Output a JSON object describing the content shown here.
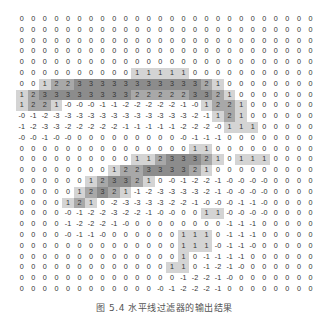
{
  "figure": {
    "caption": "图 5.4  水平线过滤器的输出结果",
    "rows": 26,
    "cols": 26,
    "shading": {
      "1": "#d4d4d4",
      "2": "#a8a8a8",
      "3": "#8c8c8c"
    },
    "grid": [
      [
        "0",
        "0",
        "0",
        "0",
        "0",
        "0",
        "0",
        "0",
        "0",
        "0",
        "0",
        "0",
        "0",
        "0",
        "0",
        "0",
        "0",
        "0",
        "0",
        "0",
        "0",
        "0",
        "0",
        "0",
        "0",
        "0"
      ],
      [
        "0",
        "0",
        "0",
        "0",
        "0",
        "0",
        "0",
        "0",
        "0",
        "0",
        "0",
        "0",
        "0",
        "0",
        "0",
        "0",
        "0",
        "0",
        "0",
        "0",
        "0",
        "0",
        "0",
        "0",
        "0",
        "0"
      ],
      [
        "0",
        "0",
        "0",
        "0",
        "0",
        "0",
        "0",
        "0",
        "0",
        "0",
        "0",
        "0",
        "0",
        "0",
        "0",
        "0",
        "0",
        "0",
        "0",
        "0",
        "0",
        "0",
        "0",
        "0",
        "0",
        "0"
      ],
      [
        "0",
        "0",
        "0",
        "0",
        "0",
        "0",
        "0",
        "0",
        "0",
        "0",
        "0",
        "0",
        "0",
        "0",
        "0",
        "0",
        "0",
        "0",
        "0",
        "0",
        "0",
        "0",
        "0",
        "0",
        "0",
        "0"
      ],
      [
        "0",
        "0",
        "0",
        "0",
        "0",
        "0",
        "0",
        "0",
        "0",
        "0",
        "0",
        "0",
        "0",
        "0",
        "0",
        "0",
        "0",
        "0",
        "0",
        "0",
        "0",
        "0",
        "0",
        "0",
        "0",
        "0"
      ],
      [
        "0",
        "0",
        "0",
        "0",
        "0",
        "0",
        "0",
        "0",
        "0",
        "0",
        "1",
        "1",
        "1",
        "1",
        "1",
        "0",
        "0",
        "0",
        "0",
        "0",
        "0",
        "0",
        "0",
        "0",
        "0",
        "0"
      ],
      [
        "0",
        "0",
        "1",
        "2",
        "2",
        "3",
        "3",
        "3",
        "3",
        "3",
        "3",
        "3",
        "3",
        "3",
        "3",
        "3",
        "2",
        "1",
        "0",
        "0",
        "0",
        "0",
        "0",
        "0",
        "0",
        "0"
      ],
      [
        "1",
        "2",
        "3",
        "3",
        "3",
        "3",
        "3",
        "3",
        "3",
        "3",
        "2",
        "2",
        "2",
        "2",
        "2",
        "3",
        "3",
        "2",
        "1",
        "0",
        "0",
        "0",
        "0",
        "0",
        "0",
        "0"
      ],
      [
        "1",
        "2",
        "2",
        "1",
        "-0",
        "-0",
        "-0",
        "-1",
        "-1",
        "-2",
        "-2",
        "-2",
        "-2",
        "-2",
        "-1",
        "-0",
        "1",
        "2",
        "2",
        "1",
        "0",
        "0",
        "0",
        "0",
        "0",
        "0"
      ],
      [
        "-0",
        "-1",
        "-2",
        "-3",
        "-3",
        "-3",
        "-3",
        "-3",
        "-3",
        "-3",
        "-3",
        "-3",
        "-3",
        "-3",
        "-3",
        "-2",
        "-1",
        "1",
        "2",
        "1",
        "0",
        "0",
        "0",
        "0",
        "0",
        "0"
      ],
      [
        "-1",
        "-2",
        "-3",
        "-3",
        "-2",
        "-2",
        "-2",
        "-2",
        "-2",
        "-1",
        "-1",
        "-1",
        "-1",
        "-1",
        "-2",
        "-2",
        "-2",
        "-0",
        "1",
        "1",
        "1",
        "0",
        "0",
        "0",
        "0",
        "0"
      ],
      [
        "-0",
        "-0",
        "-1",
        "-0",
        "-0",
        "0",
        "0",
        "0",
        "0",
        "0",
        "0",
        "0",
        "0",
        "0",
        "-0",
        "-1",
        "-1",
        "-1",
        "0",
        "0",
        "0",
        "0",
        "0",
        "0",
        "0",
        "0"
      ],
      [
        "0",
        "0",
        "0",
        "0",
        "0",
        "0",
        "0",
        "0",
        "0",
        "0",
        "0",
        "0",
        "0",
        "0",
        "0",
        "1",
        "1",
        "0",
        "0",
        "0",
        "0",
        "0",
        "0",
        "0",
        "0",
        "0"
      ],
      [
        "0",
        "0",
        "0",
        "0",
        "0",
        "0",
        "0",
        "0",
        "0",
        "0",
        "1",
        "1",
        "2",
        "3",
        "3",
        "3",
        "2",
        "1",
        "0",
        "1",
        "1",
        "1",
        "0",
        "0",
        "0",
        "0"
      ],
      [
        "0",
        "0",
        "0",
        "0",
        "0",
        "0",
        "0",
        "0",
        "1",
        "2",
        "2",
        "3",
        "3",
        "3",
        "3",
        "2",
        "1",
        "0",
        "0",
        "0",
        "0",
        "0",
        "0",
        "0",
        "0",
        "0"
      ],
      [
        "0",
        "0",
        "0",
        "0",
        "0",
        "0",
        "1",
        "2",
        "3",
        "3",
        "2",
        "1",
        "0",
        "-0",
        "-1",
        "-2",
        "-2",
        "-1",
        "-0",
        "-0",
        "-0",
        "-0",
        "0",
        "0",
        "0",
        "0"
      ],
      [
        "0",
        "0",
        "0",
        "0",
        "0",
        "1",
        "2",
        "3",
        "2",
        "1",
        "-1",
        "-2",
        "-3",
        "-3",
        "-3",
        "-3",
        "-2",
        "-1",
        "-0",
        "-0",
        "-0",
        "-0",
        "0",
        "0",
        "0",
        "0"
      ],
      [
        "0",
        "0",
        "0",
        "0",
        "1",
        "2",
        "1",
        "0",
        "-2",
        "-3",
        "-3",
        "-3",
        "-3",
        "-2",
        "-2",
        "-1",
        "-0",
        "-0",
        "-0",
        "-1",
        "-1",
        "-0",
        "0",
        "0",
        "0",
        "0"
      ],
      [
        "0",
        "0",
        "0",
        "0",
        "-0",
        "-1",
        "-2",
        "-2",
        "-3",
        "-2",
        "-2",
        "-1",
        "-0",
        "-0",
        "0",
        "0",
        "1",
        "1",
        "-0",
        "-0",
        "-0",
        "-0",
        "0",
        "0",
        "0",
        "0"
      ],
      [
        "0",
        "0",
        "0",
        "0",
        "-1",
        "-2",
        "-2",
        "-2",
        "-1",
        "-0",
        "0",
        "0",
        "0",
        "0",
        "0",
        "0",
        "0",
        "0",
        "-1",
        "-1",
        "-1",
        "0",
        "0",
        "0",
        "0",
        "0"
      ],
      [
        "0",
        "0",
        "0",
        "0",
        "-0",
        "-1",
        "-1",
        "-0",
        "0",
        "0",
        "0",
        "0",
        "0",
        "0",
        "1",
        "1",
        "1",
        "0",
        "-1",
        "-1",
        "-1",
        "0",
        "0",
        "0",
        "0",
        "0"
      ],
      [
        "0",
        "0",
        "0",
        "0",
        "0",
        "0",
        "0",
        "0",
        "0",
        "0",
        "0",
        "0",
        "0",
        "0",
        "1",
        "1",
        "1",
        "-0",
        "-1",
        "-1",
        "-0",
        "0",
        "0",
        "0",
        "0",
        "0"
      ],
      [
        "0",
        "0",
        "0",
        "0",
        "0",
        "0",
        "0",
        "0",
        "0",
        "0",
        "0",
        "0",
        "0",
        "0",
        "1",
        "0",
        "-1",
        "-1",
        "-1",
        "-1",
        "0",
        "0",
        "0",
        "0",
        "0",
        "0"
      ],
      [
        "0",
        "0",
        "0",
        "0",
        "0",
        "0",
        "0",
        "0",
        "0",
        "0",
        "0",
        "0",
        "0",
        "1",
        "1",
        "0",
        "-1",
        "-2",
        "-1",
        "-0",
        "0",
        "0",
        "0",
        "0",
        "0",
        "0"
      ],
      [
        "0",
        "0",
        "0",
        "0",
        "0",
        "0",
        "0",
        "0",
        "0",
        "0",
        "0",
        "0",
        "0",
        "0",
        "-1",
        "-2",
        "-2",
        "-1",
        "-0",
        "0",
        "0",
        "0",
        "0",
        "0",
        "0",
        "0"
      ],
      [
        "0",
        "0",
        "0",
        "0",
        "0",
        "0",
        "0",
        "0",
        "0",
        "0",
        "0",
        "0",
        "-0",
        "-1",
        "-2",
        "-2",
        "-2",
        "-1",
        "0",
        "0",
        "0",
        "0",
        "0",
        "0",
        "0",
        "0"
      ]
    ]
  }
}
